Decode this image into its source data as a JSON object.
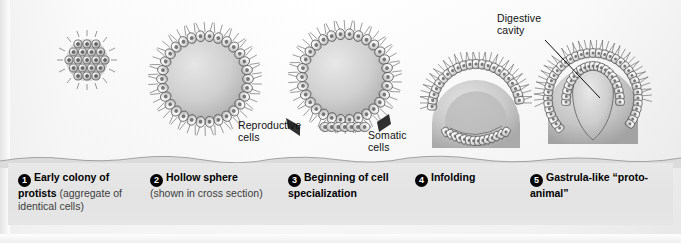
{
  "figure": {
    "background_color": "#fdfdfd",
    "band_color": "#e6e6e6",
    "ink_color": "#111111"
  },
  "annotations": [
    {
      "id": "reproductive",
      "text_line1": "Reproductive",
      "text_line2": "cells",
      "name": "reproductive-cells-label"
    },
    {
      "id": "somatic",
      "text_line1": "Somatic",
      "text_line2": "cells",
      "name": "somatic-cells-label"
    },
    {
      "id": "digestive",
      "text_line1": "Digestive",
      "text_line2": "cavity",
      "name": "digestive-cavity-label"
    }
  ],
  "stages": [
    {
      "number": "1",
      "bold": "Early colony of protists",
      "rest": " (aggregate of identical cells)",
      "name": "stage-1"
    },
    {
      "number": "2",
      "bold": "Hollow sphere",
      "rest": " (shown in cross section)",
      "name": "stage-2"
    },
    {
      "number": "3",
      "bold": "Beginning of cell specialization",
      "rest": "",
      "name": "stage-3"
    },
    {
      "number": "4",
      "bold": "Infolding",
      "rest": "",
      "name": "stage-4"
    },
    {
      "number": "5",
      "bold": "Gastrula-like “proto-animal”",
      "rest": "",
      "name": "stage-5"
    }
  ]
}
